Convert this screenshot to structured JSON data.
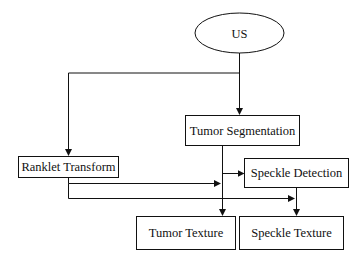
{
  "diagram": {
    "type": "flowchart",
    "nodes": {
      "us": {
        "label": "US",
        "shape": "ellipse"
      },
      "tumor_segmentation": {
        "label": "Tumor Segmentation",
        "shape": "rect"
      },
      "ranklet_transform": {
        "label": "Ranklet Transform",
        "shape": "rect"
      },
      "speckle_detection": {
        "label": "Speckle Detection",
        "shape": "rect"
      },
      "tumor_texture": {
        "label": "Tumor Texture",
        "shape": "rect"
      },
      "speckle_texture": {
        "label": "Speckle Texture",
        "shape": "rect"
      }
    },
    "edges": [
      {
        "from": "US",
        "to": "Tumor Segmentation"
      },
      {
        "from": "US",
        "to": "Ranklet Transform"
      },
      {
        "from": "Tumor Segmentation",
        "to": "Speckle Detection"
      },
      {
        "from": "Tumor Segmentation",
        "to": "Tumor Texture"
      },
      {
        "from": "Ranklet Transform",
        "to": "Tumor Texture"
      },
      {
        "from": "Ranklet Transform",
        "to": "Speckle Texture"
      },
      {
        "from": "Speckle Detection",
        "to": "Speckle Texture"
      }
    ],
    "colors": {
      "stroke": "#111111",
      "fill": "#ffffff",
      "text": "#111111"
    }
  }
}
